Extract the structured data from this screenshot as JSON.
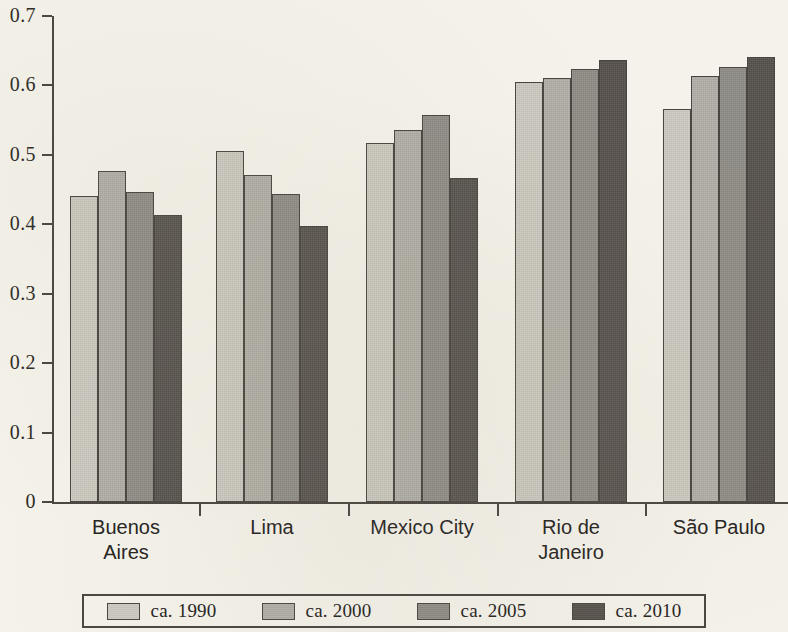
{
  "chart_data": {
    "type": "bar",
    "title": "",
    "subtitle": "",
    "xlabel": "",
    "ylabel": "",
    "ylim": [
      0,
      0.7
    ],
    "y_ticks": [
      "0",
      "0.1",
      "0.2",
      "0.3",
      "0.4",
      "0.5",
      "0.6",
      "0.7"
    ],
    "y_tick_values": [
      0,
      0.1,
      0.2,
      0.3,
      0.4,
      0.5,
      0.6,
      0.7
    ],
    "grid": false,
    "legend_position": "bottom",
    "categories": [
      "Buenos Aires",
      "Lima",
      "Mexico City",
      "Rio de Janeiro",
      "São Paulo"
    ],
    "category_label_lines": [
      [
        "Buenos",
        "Aires"
      ],
      [
        "Lima"
      ],
      [
        "Mexico City"
      ],
      [
        "Rio de",
        "Janeiro"
      ],
      [
        "São Paulo"
      ]
    ],
    "series": [
      {
        "name": "ca. 1990",
        "color": "#cdcbc2",
        "values": [
          0.441,
          0.505,
          0.517,
          0.605,
          0.566
        ]
      },
      {
        "name": "ca. 2000",
        "color": "#b1afa7",
        "values": [
          0.477,
          0.471,
          0.536,
          0.611,
          0.614
        ]
      },
      {
        "name": "ca. 2005",
        "color": "#8e8c85",
        "values": [
          0.446,
          0.443,
          0.557,
          0.624,
          0.626
        ]
      },
      {
        "name": "ca. 2010",
        "color": "#55504b",
        "values": [
          0.414,
          0.398,
          0.467,
          0.636,
          0.641
        ]
      }
    ]
  },
  "legend": {
    "entries": [
      {
        "label": "ca. 1990",
        "swatch_name": "legend-swatch-ca-1990"
      },
      {
        "label": "ca. 2000",
        "swatch_name": "legend-swatch-ca-2000"
      },
      {
        "label": "ca. 2005",
        "swatch_name": "legend-swatch-ca-2005"
      },
      {
        "label": "ca. 2010",
        "swatch_name": "legend-swatch-ca-2010"
      }
    ]
  },
  "colors": {
    "background": "#f4f2ea",
    "axis": "#4a4540",
    "text": "#26231f"
  }
}
